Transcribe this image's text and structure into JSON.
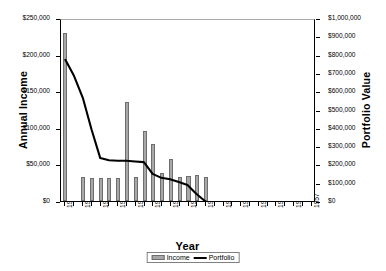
{
  "chart_data": {
    "type": "bar",
    "title": "",
    "subtitle": "",
    "xlabel": "Year",
    "ylabel": "Annual Income",
    "y2label": "Portfolio Value",
    "grid": false,
    "legend_position": "bottom",
    "x": [
      1929,
      1930,
      1931,
      1932,
      1933,
      1934,
      1935,
      1936,
      1937,
      1938,
      1939,
      1940,
      1941,
      1942,
      1943,
      1944,
      1945,
      1946,
      1947,
      1948,
      1949,
      1950,
      1951,
      1952,
      1953,
      1954,
      1955,
      1956,
      1957
    ],
    "x_tick_labels": [
      "1929",
      "1931",
      "1933",
      "1935",
      "1937",
      "1939",
      "1941",
      "1943",
      "1945",
      "1947",
      "1949",
      "1951",
      "1953",
      "1955",
      "1957"
    ],
    "x_tick_values": [
      1929,
      1931,
      1933,
      1935,
      1937,
      1939,
      1941,
      1943,
      1945,
      1947,
      1949,
      1951,
      1953,
      1955,
      1957
    ],
    "xlim": [
      1928.5,
      1957.5
    ],
    "ylim": [
      0,
      250000
    ],
    "y2lim": [
      0,
      1000000
    ],
    "y_tick_labels": [
      "$0",
      "$50,000",
      "$100,000",
      "$150,000",
      "$200,000",
      "$250,000"
    ],
    "y_tick_values": [
      0,
      50000,
      100000,
      150000,
      200000,
      250000
    ],
    "y2_tick_labels": [
      "$0",
      "$100,000",
      "$200,000",
      "$300,000",
      "$400,000",
      "$500,000",
      "$600,000",
      "$700,000",
      "$800,000",
      "$900,000",
      "$1,000,000"
    ],
    "y2_tick_values": [
      0,
      100000,
      200000,
      300000,
      400000,
      500000,
      600000,
      700000,
      800000,
      900000,
      1000000
    ],
    "series": [
      {
        "name": "Income",
        "type": "bar",
        "axis": "left",
        "color": "#a8a8a8",
        "edge_color": "#6e6e6e",
        "values": [
          230000,
          0,
          33000,
          31000,
          31000,
          31000,
          31000,
          135000,
          33000,
          95000,
          78000,
          38000,
          57000,
          33000,
          34000,
          36000,
          33000,
          0,
          0,
          0,
          0,
          0,
          0,
          0,
          0,
          0,
          0,
          0,
          0
        ]
      },
      {
        "name": "Portfolio",
        "type": "line",
        "axis": "right",
        "color": "#000000",
        "values": [
          780000,
          690000,
          570000,
          395000,
          237000,
          225000,
          222000,
          222000,
          218000,
          215000,
          150000,
          128000,
          120000,
          105000,
          88000,
          40000,
          0,
          0,
          0,
          0,
          0,
          0,
          0,
          0,
          0,
          0,
          0,
          0,
          0
        ]
      }
    ],
    "legend_entries": [
      "Income",
      "Portfolio"
    ]
  },
  "axes": {
    "x_title": "Year",
    "y_left_title": "Annual Income",
    "y_right_title": "Portfolio Value"
  },
  "legend": {
    "income_label": "Income",
    "portfolio_label": "Portfolio"
  },
  "colors": {
    "bar_fill": "#a8a8a8",
    "bar_edge": "#6e6e6e",
    "line": "#000000",
    "axis": "#000000",
    "plot_background": "#ffffff"
  }
}
